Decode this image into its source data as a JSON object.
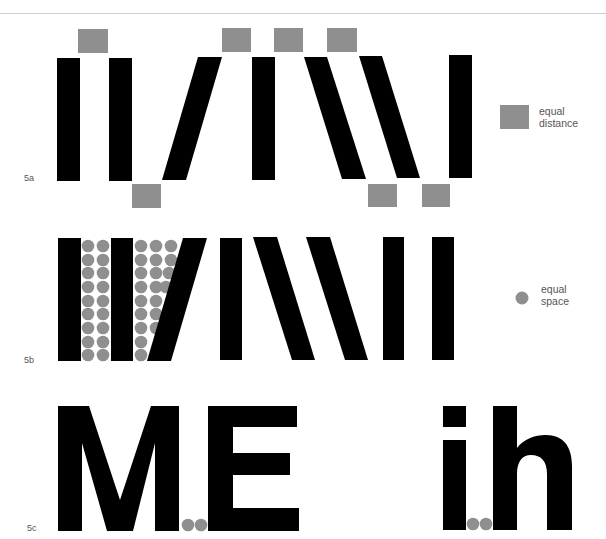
{
  "colors": {
    "ink": "#000000",
    "marker": "#8f8f8f",
    "rule": "#cfcfcf",
    "label": "#555555"
  },
  "figure_5a": {
    "label": "5a",
    "legend": {
      "icon": "gray-square-icon",
      "line1": "equal",
      "line2": "distance"
    }
  },
  "figure_5b": {
    "label": "5b",
    "legend": {
      "icon": "gray-dot-icon",
      "line1": "equal",
      "line2": "space"
    }
  },
  "figure_5c": {
    "label": "5c",
    "letters_left": "M.E",
    "letters_right": "i.h"
  }
}
